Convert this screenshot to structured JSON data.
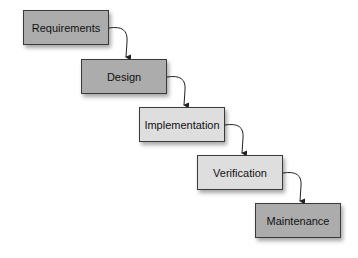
{
  "diagram": {
    "type": "waterfall",
    "stages": [
      {
        "label": "Requirements",
        "x": 23,
        "y": 10,
        "shade": "dark"
      },
      {
        "label": "Design",
        "x": 81,
        "y": 59,
        "shade": "dark"
      },
      {
        "label": "Implementation",
        "x": 139,
        "y": 107,
        "shade": "light"
      },
      {
        "label": "Verification",
        "x": 197,
        "y": 155,
        "shade": "light"
      },
      {
        "label": "Maintenance",
        "x": 255,
        "y": 203,
        "shade": "dark"
      }
    ],
    "colors": {
      "dark": "#acacac",
      "light": "#dedede",
      "border": "#3a3a3a",
      "arrow": "#222222"
    }
  }
}
